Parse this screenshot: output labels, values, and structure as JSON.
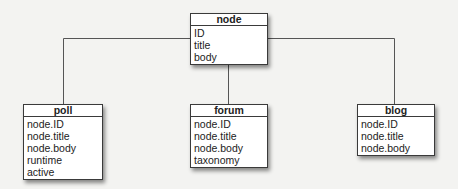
{
  "diagram": {
    "parent": {
      "name": "node",
      "fields": [
        "ID",
        "title",
        "body"
      ]
    },
    "children": [
      {
        "name": "poll",
        "fields": [
          "node.ID",
          "node.title",
          "node.body",
          "runtime",
          "active"
        ]
      },
      {
        "name": "forum",
        "fields": [
          "node.ID",
          "node.title",
          "node.body",
          "taxonomy"
        ]
      },
      {
        "name": "blog",
        "fields": [
          "node.ID",
          "node.title",
          "node.body"
        ]
      }
    ],
    "line_color": "#555555"
  }
}
